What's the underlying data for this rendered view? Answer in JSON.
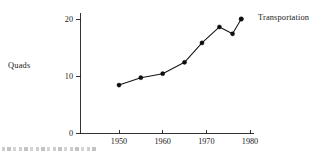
{
  "chart_data": {
    "type": "line",
    "title": "",
    "xlabel": "",
    "ylabel": "Quads",
    "xlim": [
      1946,
      1984
    ],
    "ylim": [
      0,
      21.5
    ],
    "grid": false,
    "legend_position": "inline-right-annotation",
    "annotations": [
      {
        "text": "Transportation",
        "x": 1978,
        "y": 20.0
      }
    ],
    "xticks": [
      1950,
      1960,
      1970,
      1980
    ],
    "xtick_labels": [
      "1950",
      "1960",
      "1970",
      "1980"
    ],
    "yticks": [
      0,
      10,
      20
    ],
    "ytick_labels": [
      "0",
      "10",
      "20"
    ],
    "series": [
      {
        "name": "Transportation",
        "color": "#141414",
        "marker": "filled-circle",
        "x": [
          1950,
          1955,
          1960,
          1965,
          1969,
          1973,
          1976,
          1978
        ],
        "values": [
          8.4,
          9.7,
          10.4,
          12.4,
          15.8,
          18.6,
          17.4,
          20.0
        ]
      }
    ]
  },
  "labels": {
    "y_axis_title": "Quads",
    "series_annotation": "Transportation"
  },
  "colors": {
    "line": "#141414",
    "marker": "#0d0d0d",
    "axis": "#1d1d1d",
    "text": "#1a1a1a",
    "background": "#ffffff"
  }
}
